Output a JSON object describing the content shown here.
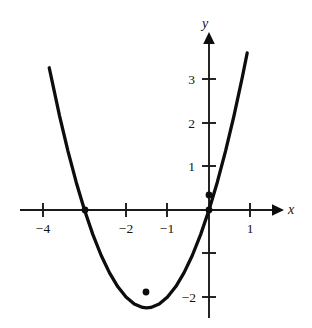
{
  "figure": {
    "title": "",
    "background_color": "#ffffff",
    "ink_color": "#0d0d0d"
  },
  "axes": {
    "x_axis_label": "x",
    "y_axis_label": "y",
    "origin_px": {
      "x": 209,
      "y": 210
    },
    "unit_px": {
      "x": 41.5,
      "y": 43.5
    },
    "x_ticks": [
      {
        "value": -4,
        "label": "−4",
        "px": 43
      },
      {
        "value": -3,
        "label": "",
        "px": 84
      },
      {
        "value": -2,
        "label": "−2",
        "px": 126
      },
      {
        "value": -1,
        "label": "−1",
        "px": 167
      },
      {
        "value": 1,
        "label": "1",
        "px": 250
      }
    ],
    "y_ticks": [
      {
        "value": 3,
        "label": "3",
        "px": 79
      },
      {
        "value": 2,
        "label": "2",
        "px": 123
      },
      {
        "value": 1,
        "label": "1",
        "px": 166
      },
      {
        "value": -1,
        "label": "",
        "px": 253
      },
      {
        "value": -2,
        "label": "−2",
        "px": 297
      }
    ]
  },
  "chart_data": {
    "type": "line",
    "title": "",
    "xlabel": "x",
    "ylabel": "y",
    "xlim": [
      -4.4,
      1.6
    ],
    "ylim": [
      -2.7,
      3.7
    ],
    "grid": false,
    "legend": "none",
    "equation": "y = x^2 + 3x",
    "series": [
      {
        "name": "parabola",
        "x": [
          -3.85,
          -3.6,
          -3.4,
          -3.2,
          -3.0,
          -2.8,
          -2.6,
          -2.4,
          -2.2,
          -2.0,
          -1.8,
          -1.6,
          -1.5,
          -1.4,
          -1.2,
          -1.0,
          -0.8,
          -0.6,
          -0.4,
          -0.2,
          0.0,
          0.2,
          0.4,
          0.6,
          0.8,
          0.92
        ],
        "y": [
          3.27,
          2.16,
          1.36,
          0.64,
          0.0,
          -0.56,
          -1.04,
          -1.44,
          -1.76,
          -2.0,
          -2.16,
          -2.24,
          -2.25,
          -2.24,
          -2.16,
          -2.0,
          -1.76,
          -1.44,
          -1.04,
          -0.56,
          0.0,
          0.64,
          1.36,
          2.16,
          3.04,
          3.61
        ]
      }
    ],
    "marked_points": [
      {
        "label": "",
        "x": -3.0,
        "y": 0.0,
        "px": {
          "x": 85,
          "y": 210
        }
      },
      {
        "label": "",
        "x": 0.0,
        "y": 0.0,
        "px": {
          "x": 209,
          "y": 210
        }
      },
      {
        "label": "",
        "x": -0.12,
        "y": 0.35,
        "px": {
          "x": 209,
          "y": 195
        }
      },
      {
        "label": "",
        "x": -1.5,
        "y": -2.25,
        "px": {
          "x": 146,
          "y": 292
        }
      }
    ]
  }
}
